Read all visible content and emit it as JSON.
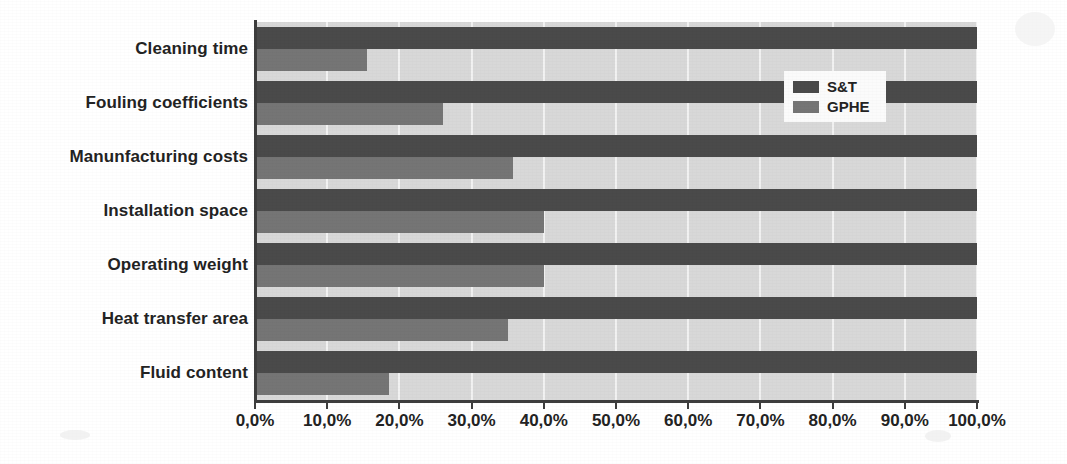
{
  "chart_data": {
    "type": "bar",
    "orientation": "horizontal",
    "title": "",
    "xlabel": "",
    "ylabel": "",
    "grid": true,
    "legend_position": "top-right",
    "xlim": [
      0,
      100
    ],
    "categories": [
      "Cleaning time",
      "Fouling coefficients",
      "Manunfacturing costs",
      "Installation space",
      "Operating weight",
      "Heat transfer area",
      "Fluid content"
    ],
    "series": [
      {
        "name": "S&T",
        "color": "#4a4a4a",
        "values": [
          100.0,
          100.0,
          100.0,
          100.0,
          100.0,
          100.0,
          100.0
        ]
      },
      {
        "name": "GPHE",
        "color": "#757575",
        "values": [
          15.5,
          26.0,
          35.7,
          40.0,
          40.0,
          35.0,
          18.5
        ]
      }
    ],
    "xticks": [
      0,
      10,
      20,
      30,
      40,
      50,
      60,
      70,
      80,
      90,
      100
    ],
    "xtick_labels": [
      "0,0%",
      "10,0%",
      "20,0%",
      "30,0%",
      "40,0%",
      "50,0%",
      "60,0%",
      "70,0%",
      "80,0%",
      "90,0%",
      "100,0%"
    ]
  },
  "legend": {
    "entries": [
      {
        "label": "S&T",
        "color": "#4a4a4a"
      },
      {
        "label": "GPHE",
        "color": "#757575"
      }
    ]
  },
  "colors": {
    "series_st": "#4a4a4a",
    "series_gphe": "#757575",
    "plot_background": "#d8d8d8",
    "gridline": "#f2f2f2",
    "axis": "#3d3d3d",
    "text": "#232323",
    "page_background": "#ffffff"
  }
}
